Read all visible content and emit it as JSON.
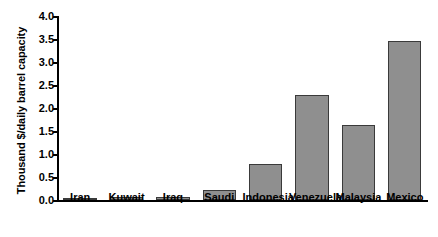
{
  "chart_data": {
    "type": "bar",
    "title": "",
    "xlabel": "",
    "ylabel": "Thousand $/daily barrel capacity",
    "categories": [
      "Iran",
      "Kuwait",
      "Iraq",
      "Saudi",
      "Indonesia",
      "Venezuela",
      "Malaysia",
      "Mexico"
    ],
    "values": [
      0.04,
      0.07,
      0.07,
      0.21,
      0.78,
      2.28,
      1.62,
      3.45
    ],
    "ylim": [
      0.0,
      4.0
    ],
    "ytick_labels": [
      "0.0",
      "0.5",
      "1.0",
      "1.5",
      "2.0",
      "2.5",
      "3.0",
      "3.5",
      "4.0"
    ],
    "ytick_values": [
      0.0,
      0.5,
      1.0,
      1.5,
      2.0,
      2.5,
      3.0,
      3.5,
      4.0
    ],
    "grid": false,
    "legend": false,
    "legend_position": "none",
    "bar_color": "#8f8f8f",
    "bar_edge_color": "#3a3a3a",
    "background_color": "#ffffff",
    "axis_color": "#000000"
  }
}
